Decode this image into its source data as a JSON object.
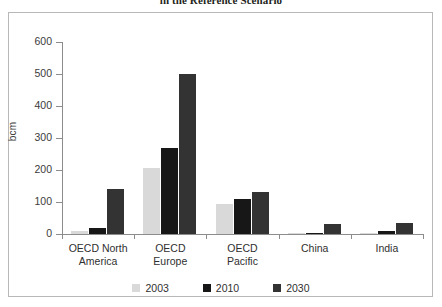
{
  "chart_data": {
    "type": "bar",
    "title": "in the Reference Scenario",
    "xlabel": "",
    "ylabel": "bcm",
    "ylim": [
      0,
      600
    ],
    "ytick_values": [
      0,
      100,
      200,
      300,
      400,
      500,
      600
    ],
    "ytick_labels": [
      "0",
      "100",
      "200",
      "300",
      "400",
      "500",
      "600"
    ],
    "grid": false,
    "legend_position": "bottom",
    "categories": [
      "OECD North\nAmerica",
      "OECD\nEurope",
      "OECD\nPacific",
      "China",
      "India"
    ],
    "category_lines": [
      [
        "OECD North",
        "America"
      ],
      [
        "OECD",
        "Europe"
      ],
      [
        "OECD",
        "Pacific"
      ],
      [
        "China",
        ""
      ],
      [
        "India",
        ""
      ]
    ],
    "series": [
      {
        "name": "2003",
        "color": "#d9d9d9",
        "values": [
          10,
          205,
          95,
          2,
          2
        ]
      },
      {
        "name": "2010",
        "color": "#171717",
        "values": [
          20,
          270,
          110,
          3,
          8
        ]
      },
      {
        "name": "2030",
        "color": "#333333",
        "values": [
          140,
          500,
          131,
          30,
          35
        ]
      }
    ]
  },
  "legend": {
    "items": [
      {
        "label": "2003",
        "color": "#d9d9d9"
      },
      {
        "label": "2010",
        "color": "#171717"
      },
      {
        "label": "2030",
        "color": "#333333"
      }
    ]
  },
  "axis": {
    "y_label": "bcm"
  }
}
